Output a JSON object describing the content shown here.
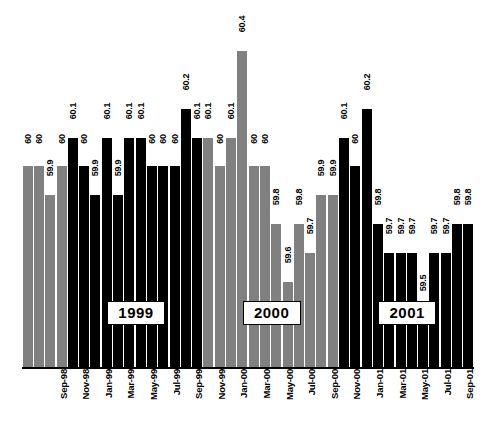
{
  "chart_data": {
    "type": "bar",
    "title": "",
    "subtitle": "",
    "xlabel": "",
    "ylabel": "",
    "ylim": [
      59.3,
      60.55
    ],
    "grid": false,
    "legend": "none",
    "value_label_position": "above-bar-rotated",
    "categories": [
      "Sep-98",
      "Oct-98",
      "Nov-98",
      "Dec-98",
      "Jan-99",
      "Feb-99",
      "Mar-99",
      "Apr-99",
      "May-99",
      "Jun-99",
      "Jul-99",
      "Aug-99",
      "Sep-99",
      "Oct-99",
      "Nov-99",
      "Dec-99",
      "Jan-00",
      "Feb-00",
      "Mar-00",
      "Apr-00",
      "May-00",
      "Jun-00",
      "Jul-00",
      "Aug-00",
      "Sep-00",
      "Oct-00",
      "Nov-00",
      "Dec-00",
      "Jan-01",
      "Feb-01",
      "Mar-01",
      "Apr-01",
      "May-01",
      "Jun-01",
      "Jul-01",
      "Aug-01",
      "Sep-01",
      "Oct-01",
      "Nov-01",
      "Dec-01"
    ],
    "values": [
      60,
      60,
      59.9,
      60,
      60.1,
      60,
      59.9,
      60.1,
      59.9,
      60.1,
      60.1,
      60,
      60,
      60,
      60.2,
      60.1,
      60.1,
      60,
      60.1,
      60.4,
      60,
      60,
      59.8,
      59.6,
      59.8,
      59.7,
      59.9,
      59.9,
      60.1,
      60,
      60.2,
      59.8,
      59.7,
      59.7,
      59.7,
      59.5,
      59.7,
      59.7,
      59.8,
      59.8
    ],
    "value_labels": [
      "60",
      "60",
      "59.9",
      "60",
      "60.1",
      "60",
      "59.9",
      "60.1",
      "59.9",
      "60.1",
      "60.1",
      "60",
      "60",
      "60",
      "60.2",
      "60.1",
      "60.1",
      "60",
      "60.1",
      "60.4",
      "60",
      "60",
      "59.8",
      "59.6",
      "59.8",
      "59.7",
      "59.9",
      "59.9",
      "60.1",
      "60",
      "60.2",
      "59.8",
      "59.7",
      "59.7",
      "59.7",
      "59.5",
      "59.7",
      "59.7",
      "59.8",
      "59.8"
    ],
    "bar_colors": [
      "#808080",
      "#808080",
      "#808080",
      "#808080",
      "#000000",
      "#000000",
      "#000000",
      "#000000",
      "#000000",
      "#000000",
      "#000000",
      "#000000",
      "#000000",
      "#000000",
      "#000000",
      "#000000",
      "#808080",
      "#808080",
      "#808080",
      "#808080",
      "#808080",
      "#808080",
      "#808080",
      "#808080",
      "#808080",
      "#808080",
      "#808080",
      "#808080",
      "#000000",
      "#000000",
      "#000000",
      "#000000",
      "#000000",
      "#000000",
      "#000000",
      "#000000",
      "#000000",
      "#000000",
      "#000000",
      "#000000"
    ],
    "tick_labels_shown": [
      {
        "index": 0,
        "label": "Sep-98"
      },
      {
        "index": 2,
        "label": "Nov-98"
      },
      {
        "index": 4,
        "label": "Jan-99"
      },
      {
        "index": 6,
        "label": "Mar-99"
      },
      {
        "index": 8,
        "label": "May-99"
      },
      {
        "index": 10,
        "label": "Jul-99"
      },
      {
        "index": 12,
        "label": "Sep-99"
      },
      {
        "index": 14,
        "label": "Nov-99"
      },
      {
        "index": 16,
        "label": "Jan-00"
      },
      {
        "index": 18,
        "label": "Mar-00"
      },
      {
        "index": 20,
        "label": "May-00"
      },
      {
        "index": 22,
        "label": "Jul-00"
      },
      {
        "index": 24,
        "label": "Sep-00"
      },
      {
        "index": 26,
        "label": "Nov-00"
      },
      {
        "index": 28,
        "label": "Jan-01"
      },
      {
        "index": 30,
        "label": "Mar-01"
      },
      {
        "index": 32,
        "label": "May-01"
      },
      {
        "index": 34,
        "label": "Jul-01"
      },
      {
        "index": 36,
        "label": "Sep-01"
      },
      {
        "index": 38,
        "label": "Nov-01"
      }
    ],
    "year_annotations": [
      {
        "label": "1999",
        "center_index": 9.5
      },
      {
        "label": "2000",
        "center_index": 21.5
      },
      {
        "label": "2001",
        "center_index": 33.5
      }
    ],
    "colors": {
      "series_a": "#808080",
      "series_b": "#000000",
      "background": "#ffffff",
      "axis": "#000000",
      "text": "#000000"
    }
  }
}
